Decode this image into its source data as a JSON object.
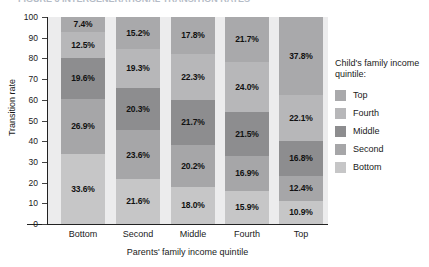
{
  "figure": {
    "title_sliver": "FIGURE 3  INTERGENERATIONAL TRANSITION RATES"
  },
  "chart_data": {
    "type": "bar",
    "stacked": true,
    "title": "",
    "xlabel": "Parents' family income quintile",
    "ylabel": "Transition rate",
    "ylim": [
      0,
      100
    ],
    "yticks": [
      "0",
      "10",
      "20",
      "30",
      "40",
      "50",
      "60",
      "70",
      "80",
      "90",
      "100"
    ],
    "grid": false,
    "legend_position": "right",
    "legend_title": "Child's family income quintile:",
    "categories": [
      "Bottom",
      "Second",
      "Middle",
      "Fourth",
      "Top"
    ],
    "series": [
      {
        "name": "Bottom",
        "color": "#c6c6c7",
        "values": [
          33.6,
          21.6,
          18.0,
          15.9,
          10.9
        ],
        "labels": [
          "33.6%",
          "21.6%",
          "18.0%",
          "15.9%",
          "10.9%"
        ]
      },
      {
        "name": "Second",
        "color": "#a6a6a8",
        "values": [
          26.9,
          23.6,
          20.2,
          16.9,
          12.4
        ],
        "labels": [
          "26.9%",
          "23.6%",
          "20.2%",
          "16.9%",
          "12.4%"
        ]
      },
      {
        "name": "Middle",
        "color": "#8d8d8f",
        "values": [
          19.6,
          20.3,
          21.7,
          21.5,
          16.8
        ],
        "labels": [
          "19.6%",
          "20.3%",
          "21.7%",
          "21.5%",
          "16.8%"
        ]
      },
      {
        "name": "Fourth",
        "color": "#b7b7b9",
        "values": [
          12.5,
          19.3,
          22.3,
          24.0,
          22.1
        ],
        "labels": [
          "12.5%",
          "19.3%",
          "22.3%",
          "24.0%",
          "22.1%"
        ]
      },
      {
        "name": "Top",
        "color": "#a9a9ab",
        "values": [
          7.4,
          15.2,
          17.8,
          21.7,
          37.8
        ],
        "labels": [
          "7.4%",
          "15.2%",
          "17.8%",
          "21.7%",
          "37.8%"
        ]
      }
    ],
    "legend_entries": [
      {
        "label": "Top",
        "color": "#a9a9ab"
      },
      {
        "label": "Fourth",
        "color": "#b7b7b9"
      },
      {
        "label": "Middle",
        "color": "#8d8d8f"
      },
      {
        "label": "Second",
        "color": "#a6a6a8"
      },
      {
        "label": "Bottom",
        "color": "#c6c6c7"
      }
    ]
  }
}
